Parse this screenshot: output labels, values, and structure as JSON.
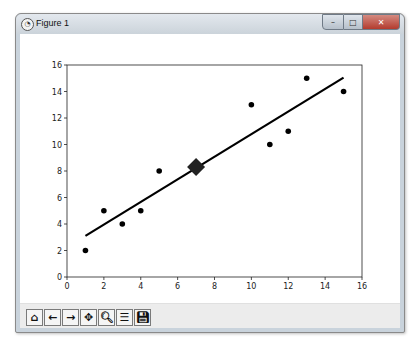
{
  "window": {
    "title": "Figure 1",
    "icon": "matplotlib-figure-icon",
    "controls": {
      "minimize": "–",
      "maximize": "□",
      "close": "✕"
    }
  },
  "toolbar": {
    "buttons": [
      {
        "name": "home",
        "icon": "home-icon",
        "glyph": "⌂"
      },
      {
        "name": "back",
        "icon": "arrow-left-icon",
        "glyph": "←"
      },
      {
        "name": "forward",
        "icon": "arrow-right-icon",
        "glyph": "→"
      },
      {
        "name": "pan",
        "icon": "move-icon",
        "glyph": "✥"
      },
      {
        "name": "zoom",
        "icon": "zoom-icon",
        "glyph": "🔍︎"
      },
      {
        "name": "configure",
        "icon": "sliders-icon",
        "glyph": "☰"
      },
      {
        "name": "save",
        "icon": "save-icon",
        "glyph": "💾︎"
      }
    ]
  },
  "chart_data": {
    "type": "scatter",
    "title": "",
    "xlabel": "",
    "ylabel": "",
    "xlim": [
      0,
      16
    ],
    "ylim": [
      0,
      16
    ],
    "x_ticks": [
      "0",
      "2",
      "4",
      "6",
      "8",
      "10",
      "12",
      "14",
      "16"
    ],
    "y_ticks": [
      "0",
      "2",
      "4",
      "6",
      "8",
      "10",
      "12",
      "14",
      "16"
    ],
    "grid": false,
    "series": [
      {
        "name": "points",
        "kind": "scatter",
        "color": "#000000",
        "x": [
          1,
          2,
          3,
          4,
          5,
          10,
          11,
          12,
          13,
          15
        ],
        "y": [
          2,
          5,
          4,
          5,
          8,
          13,
          10,
          11,
          15,
          14
        ]
      },
      {
        "name": "regression line",
        "kind": "line",
        "color": "#000000",
        "x": [
          1,
          15
        ],
        "y": [
          3.1,
          15.05
        ]
      },
      {
        "name": "centroid",
        "kind": "marker",
        "marker": "diamond",
        "color": "#222222",
        "x": [
          7
        ],
        "y": [
          8.3
        ]
      }
    ]
  }
}
